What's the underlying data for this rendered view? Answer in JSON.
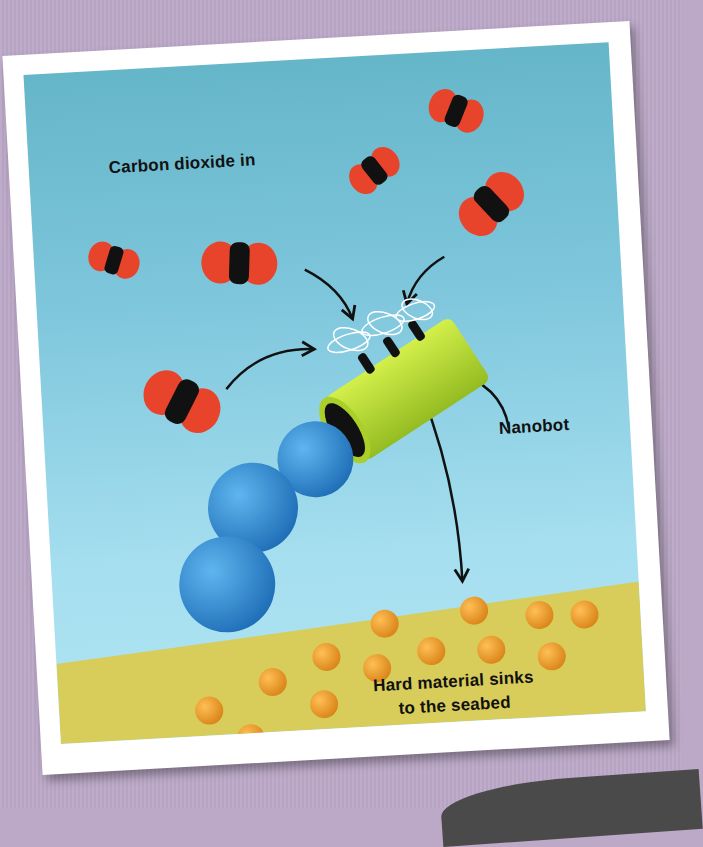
{
  "diagram": {
    "labels": {
      "carbon_dioxide": "Carbon dioxide in",
      "nanobot": "Nanobot",
      "hard_material_line1": "Hard material sinks",
      "hard_material_line2": "to the seabed"
    },
    "colors": {
      "background": "#bca9c8",
      "water_top": "#65b6c8",
      "water_bottom": "#b0e4f2",
      "seabed": "#d8cc5a",
      "oxygen_atom": "#e8442c",
      "carbon_atom": "#111111",
      "nanobot_tube": "#b5d92f",
      "blue_spheres": "#2f8fd0",
      "particles": "#f0a030"
    },
    "elements": {
      "co2_molecule_count": 7,
      "blue_sphere_count": 3,
      "particle_count": 16,
      "arrow_count": 5
    }
  }
}
